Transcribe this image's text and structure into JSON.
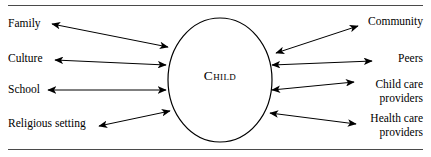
{
  "figure": {
    "type": "radial-influence-diagram",
    "center": {
      "label": "Child",
      "shape": "ellipse"
    },
    "left_nodes": [
      {
        "id": "family",
        "label": "Family"
      },
      {
        "id": "culture",
        "label": "Culture"
      },
      {
        "id": "school",
        "label": "School"
      },
      {
        "id": "religious-setting",
        "label": "Religious setting"
      }
    ],
    "right_nodes": [
      {
        "id": "community",
        "label": "Community",
        "line1": "Community",
        "line2": ""
      },
      {
        "id": "peers",
        "label": "Peers",
        "line1": "Peers",
        "line2": ""
      },
      {
        "id": "child-care-providers",
        "label": "Child care providers",
        "line1": "Child care",
        "line2": "providers"
      },
      {
        "id": "health-care-providers",
        "label": "Health care providers",
        "line1": "Health care",
        "line2": "providers"
      }
    ],
    "connectors": {
      "style": "double-headed-arrow",
      "count": 8,
      "description": "Each surrounding node is joined to the central Child ellipse by a bidirectional arrow."
    },
    "rules": {
      "top": true,
      "bottom": true
    },
    "colors": {
      "stroke": "#000000",
      "rule": "#4a4a4a",
      "background": "#ffffff",
      "text": "#000000"
    }
  }
}
